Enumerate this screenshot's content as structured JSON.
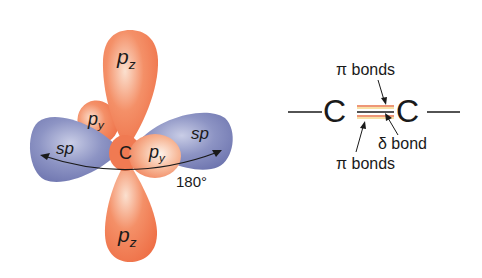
{
  "orbital_diagram": {
    "center_atom": "C",
    "lobes": [
      {
        "label": "p",
        "subscript": "z",
        "position": "top",
        "color": "#f07a52"
      },
      {
        "label": "p",
        "subscript": "z",
        "position": "bottom",
        "color": "#f07a52"
      },
      {
        "label": "p",
        "subscript": "y",
        "position": "back-left",
        "color": "#f07a52"
      },
      {
        "label": "p",
        "subscript": "y",
        "position": "front-right",
        "color": "#f5a27e"
      },
      {
        "label": "sp",
        "position": "left",
        "color": "#7a82b8"
      },
      {
        "label": "sp",
        "position": "right",
        "color": "#7a82b8"
      }
    ],
    "angle_label": "180°"
  },
  "bond_diagram": {
    "left_atom": "C",
    "right_atom": "C",
    "pi_label_top": "π bonds",
    "sigma_label": "δ bond",
    "pi_label_bottom": "π bonds",
    "pi_bond_color": "#e8734a",
    "pi_bond_color_2": "#f2c14e",
    "sigma_bond_color": "#1a1a1a"
  }
}
